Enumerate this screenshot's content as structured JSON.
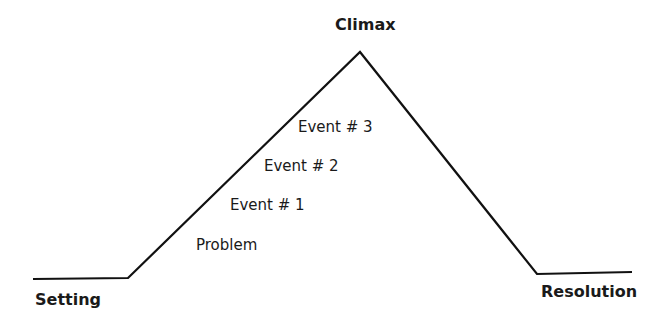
{
  "diagram": {
    "type": "plot-mountain",
    "stages": {
      "setting": "Setting",
      "climax": "Climax",
      "resolution": "Resolution"
    },
    "events": {
      "problem": "Problem",
      "event1": "Event # 1",
      "event2": "Event # 2",
      "event3": "Event # 3"
    },
    "line_color": "#111111"
  }
}
